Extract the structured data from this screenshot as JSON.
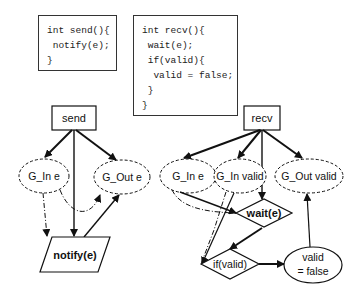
{
  "code_blocks": {
    "send": {
      "lines": [
        "int send(){",
        " notify(e);",
        "}"
      ]
    },
    "recv": {
      "lines": [
        "int recv(){",
        " wait(e);",
        " if(valid){",
        "  valid = false;",
        " }",
        "}"
      ]
    }
  },
  "nodes": {
    "send": "send",
    "recv": "recv",
    "g_in_e_send": "G_In e",
    "g_out_e": "G_Out e",
    "g_in_e_recv": "G_In e",
    "g_in_valid": "G_In valid",
    "g_out_valid": "G_Out valid",
    "notify": "notify(e)",
    "wait": "wait(e)",
    "if_valid": "if(valid)",
    "assign_line1": "valid",
    "assign_line2": "= false"
  },
  "colors": {
    "stroke": "#111111",
    "background": "#ffffff"
  }
}
